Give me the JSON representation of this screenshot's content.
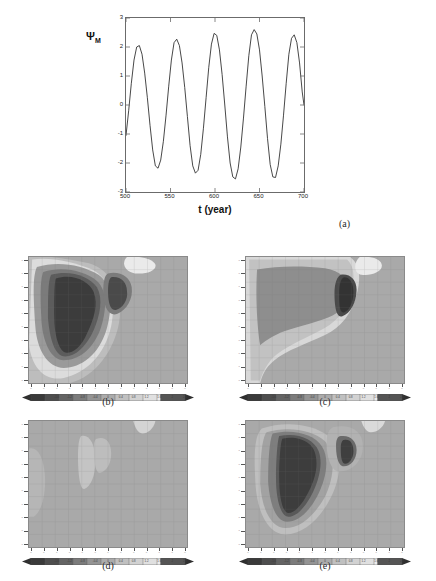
{
  "figure": {
    "background": "#ffffff",
    "panel_tags": [
      "(a)",
      "(b)",
      "(c)",
      "(d)",
      "(e)"
    ]
  },
  "chart_data": [
    {
      "id": "a",
      "type": "line",
      "tag": "(a)",
      "title": "",
      "xlabel": "t (year)",
      "ylabel": "Ψ",
      "ylabel_sub": "M",
      "xlim": [
        500,
        700
      ],
      "ylim": [
        -3,
        3
      ],
      "xticks": [
        500,
        550,
        600,
        650,
        700
      ],
      "xticklabels": [
        "500",
        "550",
        "600",
        "650",
        "700"
      ],
      "yticks": [
        -3,
        -2,
        -1,
        0,
        1,
        2,
        3
      ],
      "yticklabels": [
        "-3",
        "-2",
        "-1",
        "0",
        "1",
        "2",
        "3"
      ],
      "grid": false,
      "line_color": "#333333",
      "series": [
        {
          "name": "Psi_M",
          "comment": "five oscillation cycles, period ~40 years",
          "x": [
            500,
            503,
            506,
            509,
            512,
            515,
            518,
            521,
            524,
            527,
            530,
            533,
            536,
            539,
            542,
            545,
            548,
            551,
            554,
            557,
            560,
            563,
            566,
            569,
            572,
            575,
            578,
            581,
            584,
            587,
            590,
            593,
            596,
            599,
            602,
            605,
            608,
            611,
            614,
            617,
            620,
            623,
            626,
            629,
            632,
            635,
            638,
            641,
            644,
            647,
            650,
            653,
            656,
            659,
            662,
            665,
            668,
            671,
            674,
            677,
            680,
            683,
            686,
            689,
            692,
            695,
            698,
            700
          ],
          "y": [
            -1.05,
            -0.2,
            0.75,
            1.55,
            2.0,
            2.05,
            1.75,
            1.1,
            0.25,
            -0.7,
            -1.55,
            -2.1,
            -2.18,
            -1.9,
            -1.25,
            -0.35,
            0.65,
            1.55,
            2.15,
            2.27,
            2.05,
            1.45,
            0.6,
            -0.4,
            -1.4,
            -2.1,
            -2.35,
            -2.25,
            -1.7,
            -0.8,
            0.25,
            1.3,
            2.1,
            2.47,
            2.4,
            1.9,
            1.05,
            0.0,
            -1.1,
            -2.0,
            -2.48,
            -2.55,
            -2.2,
            -1.45,
            -0.45,
            0.65,
            1.7,
            2.42,
            2.6,
            2.45,
            1.9,
            1.0,
            -0.05,
            -1.15,
            -2.05,
            -2.48,
            -2.5,
            -2.1,
            -1.35,
            -0.35,
            0.75,
            1.75,
            2.3,
            2.42,
            2.15,
            1.45,
            0.45,
            0.0
          ]
        }
      ]
    },
    {
      "id": "b",
      "type": "heatmap",
      "tag": "(b)",
      "xlabel": "",
      "ylabel": "",
      "colorbar": {
        "ticklabels": [
          "-2.4",
          "-2",
          "-1.6",
          "-1.2",
          "-0.8",
          "-0.4",
          "0",
          "0.4",
          "0.8",
          "1.2",
          "1.6",
          "2",
          "2.4"
        ],
        "vmin": -2.4,
        "vmax": 2.4,
        "shape": "lens"
      },
      "levels": [
        "#3a3a3a",
        "#5e5e5e",
        "#7d7d7d",
        "#9a9a9a",
        "#a9a9a9",
        "#bcbcbc",
        "#d2d2d2",
        "#e4e4e4"
      ],
      "description": "large dark negative core left-of-centre with a secondary dark lobe to its right, ringed by mid and light grey contours; uniform mid-grey to the right"
    },
    {
      "id": "c",
      "type": "heatmap",
      "tag": "(c)",
      "xlabel": "",
      "ylabel": "",
      "colorbar": {
        "ticklabels": [
          "-2.4",
          "-2",
          "-1.6",
          "-1.2",
          "-0.8",
          "-0.4",
          "0",
          "0.4",
          "0.8",
          "1.2",
          "1.6",
          "2",
          "2.4"
        ],
        "vmin": -2.4,
        "vmax": 2.4,
        "shape": "lens"
      },
      "levels": [
        "#3a3a3a",
        "#5e5e5e",
        "#7d7d7d",
        "#9a9a9a",
        "#a9a9a9",
        "#bcbcbc",
        "#d2d2d2",
        "#e4e4e4"
      ],
      "description": "broad mid-dark plateau across the upper-left with a compact very dark lobe at its right edge, bounded below by light grey contours"
    },
    {
      "id": "d",
      "type": "heatmap",
      "tag": "(d)",
      "xlabel": "",
      "ylabel": "",
      "colorbar": {
        "ticklabels": [
          "-2.4",
          "-2",
          "-1.6",
          "-1.2",
          "-0.8",
          "-0.4",
          "0",
          "0.4",
          "0.8",
          "1.2",
          "1.6",
          "2",
          "2.4"
        ],
        "vmin": -2.4,
        "vmax": 2.4,
        "shape": "lens"
      },
      "levels": [
        "#3a3a3a",
        "#5e5e5e",
        "#7d7d7d",
        "#9a9a9a",
        "#a9a9a9",
        "#bcbcbc",
        "#d2d2d2",
        "#e4e4e4"
      ],
      "description": "almost featureless mid-grey field with faint light patches near the left edge, mid-field, and top-right"
    },
    {
      "id": "e",
      "type": "heatmap",
      "tag": "(e)",
      "xlabel": "",
      "ylabel": "",
      "colorbar": {
        "ticklabels": [
          "-2.4",
          "-2",
          "-1.6",
          "-1.2",
          "-0.8",
          "-0.4",
          "0",
          "0.4",
          "0.8",
          "1.2",
          "1.6",
          "2",
          "2.4"
        ],
        "vmin": -2.4,
        "vmax": 2.4,
        "shape": "lens"
      },
      "levels": [
        "#3a3a3a",
        "#5e5e5e",
        "#7d7d7d",
        "#9a9a9a",
        "#a9a9a9",
        "#bcbcbc",
        "#d2d2d2",
        "#e4e4e4"
      ],
      "description": "elongated dark core left-of-centre tapering downward with a small detached dark satellite lobe to the right"
    }
  ]
}
